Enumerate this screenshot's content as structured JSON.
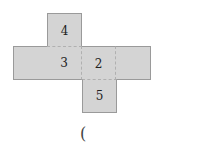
{
  "net": {
    "cells": [
      {
        "row": 0,
        "col": 1,
        "label": "4"
      },
      {
        "row": 1,
        "col": 0,
        "label": ""
      },
      {
        "row": 1,
        "col": 1,
        "label": "3"
      },
      {
        "row": 1,
        "col": 2,
        "label": "2"
      },
      {
        "row": 1,
        "col": 3,
        "label": ""
      },
      {
        "row": 2,
        "col": 2,
        "label": "5"
      }
    ],
    "fill_color": "#d4d4d4"
  },
  "answer": {
    "paren": "("
  }
}
